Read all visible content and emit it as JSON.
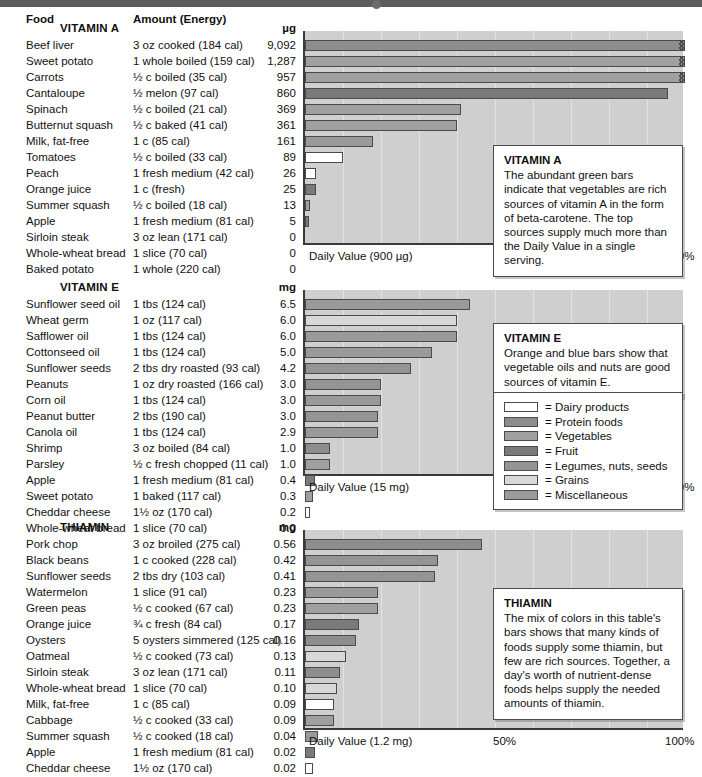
{
  "header": {
    "col_food": "Food",
    "col_amount": "Amount (Energy)"
  },
  "legend": {
    "items": [
      {
        "label": "= Dairy products",
        "color": "#ffffff"
      },
      {
        "label": "= Protein foods",
        "color": "#8d8d8d"
      },
      {
        "label": "= Vegetables",
        "color": "#a0a0a0"
      },
      {
        "label": "= Fruit",
        "color": "#7a7a7a"
      },
      {
        "label": "= Legumes, nuts, seeds",
        "color": "#949494"
      },
      {
        "label": "= Grains",
        "color": "#d8d8d8"
      },
      {
        "label": "= Miscellaneous",
        "color": "#9a9a9a"
      }
    ]
  },
  "chart_data": [
    {
      "type": "bar",
      "title": "VITAMIN A",
      "unit": "µg",
      "xlabel": "Daily Value (900 µg)",
      "tick_mid": "50%",
      "tick_end": "100%",
      "daily_value": 900,
      "xlim": [
        0,
        100
      ],
      "grid": true,
      "callout_title": "VITAMIN A",
      "callout_text": "The abundant green bars indicate that vegetables are rich sources of vitamin A in the form of beta-carotene. The top sources supply much more than the Daily Value in a single serving.",
      "categories": [
        "Beef liver",
        "Sweet potato",
        "Carrots",
        "Cantaloupe",
        "Spinach",
        "Butternut squash",
        "Milk, fat-free",
        "Tomatoes",
        "Peach",
        "Orange juice",
        "Summer squash",
        "Apple",
        "Sirloin steak",
        "Whole-wheat bread",
        "Baked potato"
      ],
      "rows": [
        {
          "food": "Beef liver",
          "amount": "3 oz cooked (184 cal)",
          "value": "9,092",
          "num": 9092,
          "pct": 100,
          "clipped": true,
          "cat": "Protein foods"
        },
        {
          "food": "Sweet potato",
          "amount": "1 whole boiled (159 cal)",
          "value": "1,287",
          "num": 1287,
          "pct": 100,
          "clipped": true,
          "cat": "Vegetables"
        },
        {
          "food": "Carrots",
          "amount": "½ c boiled (35 cal)",
          "value": "957",
          "num": 957,
          "pct": 100,
          "clipped": true,
          "cat": "Vegetables"
        },
        {
          "food": "Cantaloupe",
          "amount": "½ melon (97 cal)",
          "value": "860",
          "num": 860,
          "pct": 95.6,
          "clipped": false,
          "cat": "Fruit"
        },
        {
          "food": "Spinach",
          "amount": "½ c boiled (21 cal)",
          "value": "369",
          "num": 369,
          "pct": 41.0,
          "clipped": false,
          "cat": "Vegetables"
        },
        {
          "food": "Butternut squash",
          "amount": "½ c baked (41 cal)",
          "value": "361",
          "num": 361,
          "pct": 40.1,
          "clipped": false,
          "cat": "Vegetables"
        },
        {
          "food": "Milk, fat-free",
          "amount": "1 c (85 cal)",
          "value": "161",
          "num": 161,
          "pct": 17.9,
          "clipped": false,
          "cat": "Miscellaneous"
        },
        {
          "food": "Tomatoes",
          "amount": "½ c boiled (33 cal)",
          "value": "89",
          "num": 89,
          "pct": 9.9,
          "clipped": false,
          "cat": "Dairy products"
        },
        {
          "food": "Peach",
          "amount": "1 fresh medium (42 cal)",
          "value": "26",
          "num": 26,
          "pct": 2.9,
          "clipped": false,
          "cat": "Dairy products"
        },
        {
          "food": "Orange juice",
          "amount": "1 c (fresh)",
          "value": "25",
          "num": 25,
          "pct": 2.8,
          "clipped": false,
          "cat": "Fruit"
        },
        {
          "food": "Summer squash",
          "amount": "½ c boiled (18 cal)",
          "value": "13",
          "num": 13,
          "pct": 1.4,
          "clipped": false,
          "cat": "Vegetables"
        },
        {
          "food": "Apple",
          "amount": "1 fresh medium (81 cal)",
          "value": "5",
          "num": 5,
          "pct": 0.6,
          "clipped": false,
          "cat": "Fruit"
        },
        {
          "food": "Sirloin steak",
          "amount": "3 oz lean (171 cal)",
          "value": "0",
          "num": 0,
          "pct": 0,
          "clipped": false,
          "cat": "Protein foods"
        },
        {
          "food": "Whole-wheat bread",
          "amount": "1 slice (70 cal)",
          "value": "0",
          "num": 0,
          "pct": 0,
          "clipped": false,
          "cat": "Grains"
        },
        {
          "food": "Baked potato",
          "amount": "1 whole (220 cal)",
          "value": "0",
          "num": 0,
          "pct": 0,
          "clipped": false,
          "cat": "Vegetables"
        }
      ]
    },
    {
      "type": "bar",
      "title": "VITAMIN E",
      "unit": "mg",
      "xlabel": "Daily Value (15 mg)",
      "tick_mid": "50%",
      "tick_end": "100%",
      "daily_value": 15,
      "xlim": [
        0,
        100
      ],
      "grid": true,
      "callout_title": "VITAMIN E",
      "callout_text": "Orange and blue bars show that vegetable oils and nuts are good sources of vitamin E.",
      "categories": [
        "Sunflower seed oil",
        "Wheat germ",
        "Safflower oil",
        "Cottonseed oil",
        "Sunflower seeds",
        "Peanuts",
        "Corn oil",
        "Peanut butter",
        "Canola oil",
        "Shrimp",
        "Parsley",
        "Apple",
        "Sweet potato",
        "Cheddar cheese",
        "Whole-wheat bread"
      ],
      "rows": [
        {
          "food": "Sunflower seed oil",
          "amount": "1 tbs (124 cal)",
          "value": "6.5",
          "num": 6.5,
          "pct": 43.3,
          "clipped": false,
          "cat": "Miscellaneous"
        },
        {
          "food": "Wheat germ",
          "amount": "1 oz (117 cal)",
          "value": "6.0",
          "num": 6.0,
          "pct": 40.0,
          "clipped": false,
          "cat": "Grains"
        },
        {
          "food": "Safflower oil",
          "amount": "1 tbs (124 cal)",
          "value": "6.0",
          "num": 6.0,
          "pct": 40.0,
          "clipped": false,
          "cat": "Miscellaneous"
        },
        {
          "food": "Cottonseed oil",
          "amount": "1 tbs (124 cal)",
          "value": "5.0",
          "num": 5.0,
          "pct": 33.3,
          "clipped": false,
          "cat": "Miscellaneous"
        },
        {
          "food": "Sunflower seeds",
          "amount": "2 tbs dry roasted (93 cal)",
          "value": "4.2",
          "num": 4.2,
          "pct": 28.0,
          "clipped": false,
          "cat": "Legumes, nuts, seeds"
        },
        {
          "food": "Peanuts",
          "amount": "1 oz dry roasted (166 cal)",
          "value": "3.0",
          "num": 3.0,
          "pct": 20.0,
          "clipped": false,
          "cat": "Legumes, nuts, seeds"
        },
        {
          "food": "Corn oil",
          "amount": "1 tbs (124 cal)",
          "value": "3.0",
          "num": 3.0,
          "pct": 20.0,
          "clipped": false,
          "cat": "Miscellaneous"
        },
        {
          "food": "Peanut butter",
          "amount": "2 tbs (190 cal)",
          "value": "3.0",
          "num": 3.0,
          "pct": 19.3,
          "clipped": false,
          "cat": "Legumes, nuts, seeds"
        },
        {
          "food": "Canola oil",
          "amount": "1 tbs (124 cal)",
          "value": "2.9",
          "num": 2.9,
          "pct": 19.3,
          "clipped": false,
          "cat": "Miscellaneous"
        },
        {
          "food": "Shrimp",
          "amount": "3 oz boiled (84 cal)",
          "value": "1.0",
          "num": 1.0,
          "pct": 6.7,
          "clipped": false,
          "cat": "Protein foods"
        },
        {
          "food": "Parsley",
          "amount": "½ c fresh chopped (11 cal)",
          "value": "1.0",
          "num": 1.0,
          "pct": 6.7,
          "clipped": false,
          "cat": "Vegetables"
        },
        {
          "food": "Apple",
          "amount": "1 fresh medium (81 cal)",
          "value": "0.4",
          "num": 0.4,
          "pct": 2.7,
          "clipped": false,
          "cat": "Fruit"
        },
        {
          "food": "Sweet potato",
          "amount": "1 baked (117 cal)",
          "value": "0.3",
          "num": 0.3,
          "pct": 2.0,
          "clipped": false,
          "cat": "Vegetables"
        },
        {
          "food": "Cheddar cheese",
          "amount": "1½ oz (170 cal)",
          "value": "0.2",
          "num": 0.2,
          "pct": 1.3,
          "clipped": false,
          "cat": "Dairy products"
        },
        {
          "food": "Whole-wheat bread",
          "amount": "1 slice (70 cal)",
          "value": "0.0",
          "num": 0.0,
          "pct": 0,
          "clipped": false,
          "cat": "Grains"
        }
      ]
    },
    {
      "type": "bar",
      "title": "THIAMIN",
      "unit": "mg",
      "xlabel": "Daily Value (1.2 mg)",
      "tick_mid": "50%",
      "tick_end": "100%",
      "daily_value": 1.2,
      "xlim": [
        0,
        100
      ],
      "grid": true,
      "callout_title": "THIAMIN",
      "callout_text": "The mix of colors in this table's bars shows that many kinds of foods supply some thiamin, but few are rich sources. Together, a day's worth of nutrient-dense foods helps supply the needed amounts of thiamin.",
      "categories": [
        "Pork chop",
        "Black beans",
        "Sunflower seeds",
        "Watermelon",
        "Green peas",
        "Orange juice",
        "Oysters",
        "Oatmeal",
        "Sirloin steak",
        "Whole-wheat bread",
        "Milk, fat-free",
        "Cabbage",
        "Summer squash",
        "Apple",
        "Cheddar cheese"
      ],
      "rows": [
        {
          "food": "Pork chop",
          "amount": "3 oz broiled  (275 cal)",
          "value": "0.56",
          "num": 0.56,
          "pct": 46.7,
          "clipped": false,
          "cat": "Protein foods"
        },
        {
          "food": "Black beans",
          "amount": "1 c cooked (228 cal)",
          "value": "0.42",
          "num": 0.42,
          "pct": 35.0,
          "clipped": false,
          "cat": "Legumes, nuts, seeds"
        },
        {
          "food": "Sunflower seeds",
          "amount": "2 tbs dry (103 cal)",
          "value": "0.41",
          "num": 0.41,
          "pct": 34.2,
          "clipped": false,
          "cat": "Legumes, nuts, seeds"
        },
        {
          "food": "Watermelon",
          "amount": "1 slice (91 cal)",
          "value": "0.23",
          "num": 0.23,
          "pct": 19.2,
          "clipped": false,
          "cat": "Miscellaneous"
        },
        {
          "food": "Green peas",
          "amount": "½ c cooked (67 cal)",
          "value": "0.23",
          "num": 0.23,
          "pct": 19.2,
          "clipped": false,
          "cat": "Vegetables"
        },
        {
          "food": "Orange juice",
          "amount": "¾ c fresh (84 cal)",
          "value": "0.17",
          "num": 0.17,
          "pct": 14.2,
          "clipped": false,
          "cat": "Fruit"
        },
        {
          "food": "Oysters",
          "amount": "5 oysters simmered (125 cal)",
          "value": "0.16",
          "num": 0.16,
          "pct": 13.3,
          "clipped": false,
          "cat": "Protein foods"
        },
        {
          "food": "Oatmeal",
          "amount": "½ c cooked (73 cal)",
          "value": "0.13",
          "num": 0.13,
          "pct": 10.8,
          "clipped": false,
          "cat": "Grains"
        },
        {
          "food": "Sirloin steak",
          "amount": "3 oz lean (171 cal)",
          "value": "0.11",
          "num": 0.11,
          "pct": 9.2,
          "clipped": false,
          "cat": "Protein foods"
        },
        {
          "food": "Whole-wheat bread",
          "amount": "1 slice (70 cal)",
          "value": "0.10",
          "num": 0.1,
          "pct": 8.3,
          "clipped": false,
          "cat": "Grains"
        },
        {
          "food": "Milk, fat-free",
          "amount": "1 c (85 cal)",
          "value": "0.09",
          "num": 0.09,
          "pct": 7.5,
          "clipped": false,
          "cat": "Dairy products"
        },
        {
          "food": "Cabbage",
          "amount": "½ c cooked (33 cal)",
          "value": "0.09",
          "num": 0.09,
          "pct": 7.5,
          "clipped": false,
          "cat": "Vegetables"
        },
        {
          "food": "Summer squash",
          "amount": "½ c cooked (18 cal)",
          "value": "0.04",
          "num": 0.04,
          "pct": 3.3,
          "clipped": false,
          "cat": "Miscellaneous"
        },
        {
          "food": "Apple",
          "amount": "1 fresh medium (81 cal)",
          "value": "0.02",
          "num": 0.02,
          "pct": 2.5,
          "clipped": false,
          "cat": "Fruit"
        },
        {
          "food": "Cheddar cheese",
          "amount": "1½ oz (170 cal)",
          "value": "0.02",
          "num": 0.02,
          "pct": 2.1,
          "clipped": false,
          "cat": "Dairy products"
        }
      ]
    }
  ]
}
